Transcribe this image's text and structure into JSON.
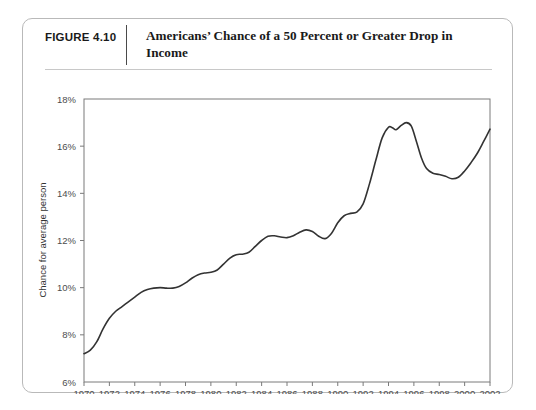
{
  "figure": {
    "number": "FIGURE 4.10",
    "title": "Americans’ Chance of a 50 Percent or Greater Drop in Income"
  },
  "chart_data": {
    "type": "line",
    "title": "Americans’ Chance of a 50 Percent or Greater Drop in Income",
    "xlabel": "",
    "ylabel": "Chance for average person",
    "xlim": [
      1970,
      2002
    ],
    "ylim": [
      6,
      18
    ],
    "ytick_labels": [
      "18%",
      "16%",
      "14%",
      "12%",
      "10%",
      "8%",
      "6%"
    ],
    "ytick_values": [
      18,
      16,
      14,
      12,
      10,
      8,
      6
    ],
    "xtick_labels": [
      "1970",
      "1972",
      "1974",
      "1976",
      "1978",
      "1980",
      "1982",
      "1984",
      "1986",
      "1988",
      "1990",
      "1992",
      "1994",
      "1996",
      "1998",
      "2000",
      "2002"
    ],
    "xtick_values": [
      1970,
      1972,
      1974,
      1976,
      1978,
      1980,
      1982,
      1984,
      1986,
      1988,
      1990,
      1992,
      1994,
      1996,
      1998,
      2000,
      2002
    ],
    "grid": false,
    "legend": false,
    "line_color": "#333333",
    "series": [
      {
        "name": "Chance for average person",
        "x": [
          1970,
          1971,
          1972,
          1973,
          1974,
          1975,
          1976,
          1977,
          1978,
          1979,
          1980,
          1981,
          1982,
          1983,
          1984,
          1985,
          1986,
          1987,
          1988,
          1989,
          1990,
          1991,
          1992,
          1993,
          1994,
          1995,
          1996,
          1997,
          1998,
          1999,
          2000,
          2001,
          2002
        ],
        "values": [
          7.2,
          7.6,
          8.6,
          9.2,
          9.5,
          9.8,
          10.0,
          10.0,
          10.1,
          10.4,
          10.7,
          10.8,
          11.2,
          11.5,
          11.6,
          12.0,
          12.2,
          12.1,
          12.0,
          12.2,
          12.3,
          12.1,
          12.6,
          13.1,
          13.3,
          13.3,
          13.9,
          15.3,
          16.6,
          16.8,
          16.7,
          17.0,
          16.9
        ]
      }
    ],
    "annotations": []
  },
  "path_points": [
    [
      1970.0,
      7.2
    ],
    [
      1970.5,
      7.35
    ],
    [
      1971.0,
      7.7
    ],
    [
      1971.5,
      8.25
    ],
    [
      1972.0,
      8.7
    ],
    [
      1972.5,
      9.0
    ],
    [
      1973.0,
      9.2
    ],
    [
      1973.5,
      9.4
    ],
    [
      1974.0,
      9.6
    ],
    [
      1974.5,
      9.8
    ],
    [
      1975.0,
      9.92
    ],
    [
      1975.5,
      9.98
    ],
    [
      1976.0,
      10.0
    ],
    [
      1976.5,
      9.98
    ],
    [
      1977.0,
      9.98
    ],
    [
      1977.5,
      10.05
    ],
    [
      1978.0,
      10.2
    ],
    [
      1978.5,
      10.4
    ],
    [
      1979.0,
      10.55
    ],
    [
      1979.5,
      10.62
    ],
    [
      1980.0,
      10.65
    ],
    [
      1980.5,
      10.75
    ],
    [
      1981.0,
      11.0
    ],
    [
      1981.5,
      11.25
    ],
    [
      1982.0,
      11.4
    ],
    [
      1982.5,
      11.42
    ],
    [
      1983.0,
      11.5
    ],
    [
      1983.5,
      11.75
    ],
    [
      1984.0,
      12.0
    ],
    [
      1984.5,
      12.18
    ],
    [
      1985.0,
      12.2
    ],
    [
      1985.5,
      12.15
    ],
    [
      1986.0,
      12.12
    ],
    [
      1986.5,
      12.2
    ],
    [
      1987.0,
      12.35
    ],
    [
      1987.5,
      12.45
    ],
    [
      1988.0,
      12.38
    ],
    [
      1988.5,
      12.18
    ],
    [
      1989.0,
      12.08
    ],
    [
      1989.5,
      12.3
    ],
    [
      1990.0,
      12.75
    ],
    [
      1990.5,
      13.05
    ],
    [
      1991.0,
      13.15
    ],
    [
      1991.5,
      13.2
    ],
    [
      1992.0,
      13.55
    ],
    [
      1992.5,
      14.4
    ],
    [
      1993.0,
      15.4
    ],
    [
      1993.5,
      16.35
    ],
    [
      1994.0,
      16.8
    ],
    [
      1994.3,
      16.78
    ],
    [
      1994.6,
      16.7
    ],
    [
      1995.0,
      16.88
    ],
    [
      1995.4,
      17.0
    ],
    [
      1995.8,
      16.85
    ],
    [
      1996.2,
      16.2
    ],
    [
      1996.6,
      15.5
    ],
    [
      1997.0,
      15.05
    ],
    [
      1997.5,
      14.85
    ],
    [
      1998.0,
      14.8
    ],
    [
      1998.5,
      14.72
    ],
    [
      1999.0,
      14.62
    ],
    [
      1999.5,
      14.68
    ],
    [
      2000.0,
      14.95
    ],
    [
      2000.5,
      15.3
    ],
    [
      2001.0,
      15.7
    ],
    [
      2001.5,
      16.2
    ],
    [
      2002.0,
      16.72
    ]
  ]
}
